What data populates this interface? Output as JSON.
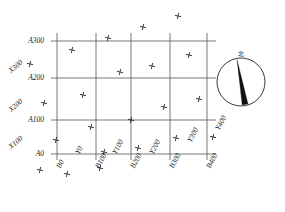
{
  "figure": {
    "kind": "excavation-grid-plan",
    "background_color": "#ffffff",
    "line_color": "#555555",
    "marker_color": "#222222",
    "text_color": "#1a1a1a"
  },
  "compass": {
    "north_label": "北",
    "circle_center": [
      241,
      82
    ],
    "circle_radius": 24
  },
  "grid": {
    "x_lines_px": [
      57,
      96,
      131,
      170,
      207
    ],
    "y_lines_px": [
      41,
      78,
      120,
      154
    ],
    "x_extent_px": [
      51,
      216
    ],
    "y_extent_px": [
      33,
      160
    ]
  },
  "left_axis": {
    "primary": [
      {
        "label": "A300",
        "y_px": 41
      },
      {
        "label": "A200",
        "y_px": 78
      },
      {
        "label": "A100",
        "y_px": 120
      },
      {
        "label": "A0",
        "y_px": 154
      }
    ],
    "secondary": [
      {
        "label": "X300",
        "y_px": 64
      },
      {
        "label": "X200",
        "y_px": 103
      },
      {
        "label": "X100",
        "y_px": 140
      }
    ]
  },
  "bottom_axis": {
    "primary": [
      {
        "label": "B0",
        "x_px": 57
      },
      {
        "label": "B100",
        "x_px": 96
      },
      {
        "label": "B200",
        "x_px": 131
      },
      {
        "label": "B300",
        "x_px": 170
      },
      {
        "label": "B400",
        "x_px": 207
      }
    ],
    "secondary": [
      {
        "label": "Y0",
        "x_px": 76
      },
      {
        "label": "Y100",
        "x_px": 113
      },
      {
        "label": "Y200",
        "x_px": 150
      },
      {
        "label": "Y300",
        "x_px": 188
      },
      {
        "label": "Y400",
        "x_px": 216
      }
    ]
  },
  "chart_data": {
    "type": "scatter",
    "title": "",
    "xlabel": "",
    "ylabel": "",
    "grid": true,
    "legend": null,
    "marker": "cross",
    "point_count": 22,
    "points_px": [
      [
        178,
        16
      ],
      [
        143,
        27
      ],
      [
        108,
        38
      ],
      [
        72,
        50
      ],
      [
        189,
        55
      ],
      [
        152,
        66
      ],
      [
        120,
        72
      ],
      [
        83,
        95
      ],
      [
        199,
        99
      ],
      [
        44,
        103
      ],
      [
        164,
        107
      ],
      [
        131,
        120
      ],
      [
        91,
        127
      ],
      [
        56,
        140
      ],
      [
        176,
        138
      ],
      [
        138,
        148
      ],
      [
        104,
        152
      ],
      [
        213,
        137
      ],
      [
        67,
        174
      ],
      [
        40,
        170
      ],
      [
        100,
        168
      ],
      [
        30,
        64
      ]
    ]
  }
}
